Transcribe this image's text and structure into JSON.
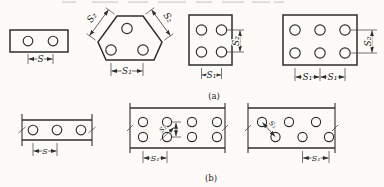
{
  "captions": {
    "row_a": "(a)",
    "row_b": "(b)"
  },
  "dims": {
    "s": "S",
    "s1": "S₁",
    "s2": "S₂"
  },
  "colors": {
    "line": "#2e2e2e",
    "text": "#1d1d1d",
    "background": "#fcfbf8"
  },
  "figures": {
    "row_a": [
      {
        "shape": "rectangle",
        "holes": 2,
        "dimension_labels": [
          "S"
        ]
      },
      {
        "shape": "truncated-triangle",
        "holes": 3,
        "dimension_labels": [
          "S₂",
          "S₂",
          "S₁"
        ]
      },
      {
        "shape": "rectangle",
        "holes": 4,
        "dimension_labels": [
          "S₁",
          "S₂"
        ]
      },
      {
        "shape": "rectangle",
        "holes": 6,
        "dimension_labels": [
          "S₁",
          "S₁",
          "S₂"
        ]
      }
    ],
    "row_b": [
      {
        "shape": "strip-with-break-marks",
        "holes": 3,
        "dimension_labels": [
          "S"
        ]
      },
      {
        "shape": "strip-with-break-marks",
        "holes": 8,
        "dimension_labels": [
          "S₂",
          "S₁"
        ]
      },
      {
        "shape": "strip-with-break-marks-staggered",
        "holes": 6,
        "dimension_labels": [
          "S₂",
          "S₁"
        ]
      }
    ]
  }
}
